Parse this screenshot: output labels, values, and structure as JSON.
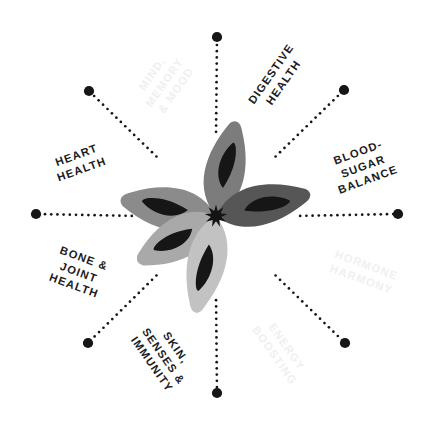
{
  "diagram": {
    "type": "radial-spoke-diagram",
    "center": {
      "x": 216,
      "y": 216
    },
    "spoke_radius": 180,
    "spoke_count": 8,
    "background_color": "#ffffff",
    "label_color": "#1c1c1c",
    "faded_label_color": "#f0f0f0",
    "dot_color": "#161616"
  },
  "labels": [
    {
      "id": "mind-memory-mood",
      "text": "MIND,\nMEMORY\n& MOOD",
      "state": "faded",
      "angle_deg": -55,
      "x": 164,
      "y": 82
    },
    {
      "id": "digestive-health",
      "text": "DIGESTIVE\nHEALTH",
      "state": "active",
      "angle_deg": -55,
      "x": 277,
      "y": 78
    },
    {
      "id": "blood-sugar-balance",
      "text": "BLOOD-\nSUGAR\nBALANCE",
      "state": "active",
      "angle_deg": -20,
      "x": 363,
      "y": 166
    },
    {
      "id": "hormone-harmony",
      "text": "HORMONE\nHARMONY",
      "state": "faded",
      "angle_deg": 20,
      "x": 364,
      "y": 272
    },
    {
      "id": "energy-boosting",
      "text": "ENERGY\nBOOSTING",
      "state": "faded",
      "angle_deg": 55,
      "x": 281,
      "y": 351
    },
    {
      "id": "skin-senses-immunity",
      "text": "SKIN,\nSENSES &\nIMMUNITY",
      "state": "active",
      "angle_deg": 55,
      "x": 164,
      "y": 356
    },
    {
      "id": "bone-joint-health",
      "text": "BONE &\nJOINT\nHEALTH",
      "state": "active",
      "angle_deg": 20,
      "x": 79,
      "y": 272
    },
    {
      "id": "heart-health",
      "text": "HEART\nHEALTH",
      "state": "active",
      "angle_deg": -20,
      "x": 79,
      "y": 162
    }
  ],
  "spokes": [
    {
      "id": "spoke-up",
      "angle_deg": -90,
      "endpoint": {
        "x": 217,
        "y": 37
      }
    },
    {
      "id": "spoke-up-right",
      "angle_deg": -45,
      "endpoint": {
        "x": 344,
        "y": 90
      }
    },
    {
      "id": "spoke-right",
      "angle_deg": 0,
      "endpoint": {
        "x": 398,
        "y": 214
      }
    },
    {
      "id": "spoke-down-right",
      "angle_deg": 45,
      "endpoint": {
        "x": 345,
        "y": 343
      }
    },
    {
      "id": "spoke-down",
      "angle_deg": 90,
      "endpoint": {
        "x": 217,
        "y": 393
      }
    },
    {
      "id": "spoke-down-left",
      "angle_deg": 135,
      "endpoint": {
        "x": 88,
        "y": 343
      }
    },
    {
      "id": "spoke-left",
      "angle_deg": 180,
      "endpoint": {
        "x": 36,
        "y": 214
      }
    },
    {
      "id": "spoke-up-left",
      "angle_deg": -135,
      "endpoint": {
        "x": 89,
        "y": 91
      }
    }
  ],
  "flower": {
    "name": "five-petal-watercolor-flower",
    "center_color": "#141414",
    "petals": [
      {
        "id": "petal-left",
        "fill": "#8b8b8b",
        "angle_deg": 192,
        "length": 96,
        "width": 33
      },
      {
        "id": "petal-upper",
        "fill": "#7b7b7b",
        "angle_deg": 284,
        "length": 96,
        "width": 31
      },
      {
        "id": "petal-right",
        "fill": "#575757",
        "angle_deg": 349,
        "length": 96,
        "width": 31
      },
      {
        "id": "petal-lower-left",
        "fill": "#a9a9a9",
        "angle_deg": 152,
        "length": 90,
        "width": 32
      },
      {
        "id": "petal-lower",
        "fill": "#c2c2c2",
        "angle_deg": 104,
        "length": 98,
        "width": 30
      }
    ],
    "inner_marking_color": "#141414"
  }
}
